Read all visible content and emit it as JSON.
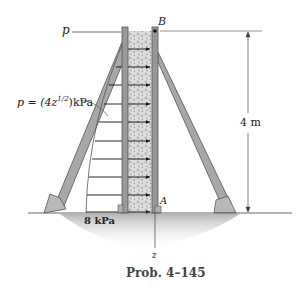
{
  "figure": {
    "caption": "Prob. 4–145",
    "labels": {
      "p_top": "p",
      "p_formula": "p = (4z",
      "p_exp": "1/2",
      "p_unit": ")kPa",
      "point_b": "B",
      "point_a": "A",
      "axis_z": "z",
      "height_dim": "4 m",
      "base_pressure": "8 kPa"
    },
    "colors": {
      "board": "#9a9a9a",
      "board_edge": "#5a5a5a",
      "strut": "#a8a8a8",
      "fill": "#d6d6d6",
      "ground_shadow": "#bdbdbd",
      "line": "#333333"
    }
  }
}
